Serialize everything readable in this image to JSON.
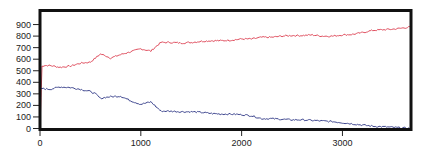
{
  "chart_data": {
    "type": "line",
    "title": "",
    "xlabel": "",
    "ylabel": "",
    "xlim": [
      0,
      3680
    ],
    "ylim": [
      0,
      1020
    ],
    "grid": false,
    "legend": null,
    "x_ticks": [
      0,
      1000,
      2000,
      3000
    ],
    "y_ticks": [
      0,
      100,
      200,
      300,
      400,
      500,
      600,
      700,
      800,
      900
    ],
    "series": [
      {
        "name": "upper",
        "color": "#e05060",
        "x": [
          0,
          20,
          40,
          100,
          200,
          300,
          400,
          500,
          550,
          600,
          650,
          700,
          800,
          900,
          1000,
          1050,
          1100,
          1150,
          1200,
          1300,
          1400,
          1500,
          1600,
          1700,
          1800,
          1900,
          2000,
          2100,
          2200,
          2300,
          2400,
          2500,
          2600,
          2700,
          2800,
          2900,
          3000,
          3100,
          3200,
          3300,
          3400,
          3500,
          3600,
          3680
        ],
        "values": [
          0,
          540,
          545,
          545,
          530,
          540,
          565,
          575,
          610,
          645,
          630,
          610,
          640,
          665,
          690,
          680,
          670,
          710,
          745,
          745,
          740,
          745,
          755,
          760,
          760,
          765,
          775,
          775,
          790,
          790,
          800,
          805,
          805,
          810,
          800,
          800,
          810,
          815,
          830,
          850,
          855,
          860,
          870,
          880
        ]
      },
      {
        "name": "lower",
        "color": "#404890",
        "x": [
          0,
          20,
          100,
          200,
          300,
          400,
          500,
          550,
          600,
          650,
          700,
          800,
          900,
          1000,
          1050,
          1100,
          1150,
          1200,
          1300,
          1400,
          1500,
          1600,
          1700,
          1800,
          1900,
          2000,
          2100,
          2200,
          2300,
          2400,
          2500,
          2600,
          2700,
          2800,
          2900,
          3000,
          3100,
          3200,
          3300,
          3400,
          3500,
          3600,
          3680
        ],
        "values": [
          340,
          345,
          340,
          360,
          355,
          340,
          320,
          300,
          260,
          270,
          275,
          280,
          240,
          210,
          220,
          230,
          190,
          150,
          150,
          145,
          145,
          140,
          130,
          125,
          125,
          120,
          110,
          85,
          85,
          80,
          75,
          75,
          70,
          65,
          60,
          50,
          40,
          30,
          20,
          15,
          10,
          5,
          0
        ]
      }
    ]
  }
}
